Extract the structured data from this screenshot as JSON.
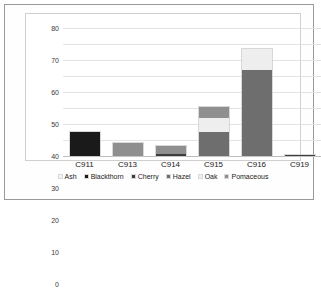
{
  "chart_data": {
    "type": "bar",
    "stacked": true,
    "title": "",
    "xlabel": "",
    "ylabel": "Fragment count",
    "ylim": [
      0,
      80
    ],
    "yticks": [
      0,
      10,
      20,
      30,
      40,
      50,
      60,
      70,
      80
    ],
    "grid": true,
    "legend_position": "bottom",
    "categories": [
      "C911",
      "C913",
      "C914",
      "C915",
      "C916",
      "C919"
    ],
    "series": [
      {
        "name": "Ash",
        "color": "#f2f2f2",
        "values": [
          0,
          0,
          0,
          0,
          0,
          0
        ]
      },
      {
        "name": "Blackthorn",
        "color": "#1a1a1a",
        "values": [
          15,
          0,
          0,
          0,
          0,
          0
        ]
      },
      {
        "name": "Cherry",
        "color": "#3d3d3d",
        "values": [
          0,
          0,
          1.5,
          0,
          0,
          0.8
        ]
      },
      {
        "name": "Hazel",
        "color": "#6e6e6e",
        "values": [
          0,
          0,
          0,
          15,
          54,
          0
        ]
      },
      {
        "name": "Oak",
        "color": "#eeeeee",
        "values": [
          0,
          0,
          0,
          9,
          13,
          0
        ]
      },
      {
        "name": "Pomaceous",
        "color": "#8f8f8f",
        "values": [
          0,
          8,
          5,
          6.5,
          0,
          0
        ]
      }
    ],
    "totals": [
      15,
      8,
      6.5,
      30.5,
      67,
      0.8
    ]
  },
  "axis": {
    "y_title": "Fragment count"
  }
}
